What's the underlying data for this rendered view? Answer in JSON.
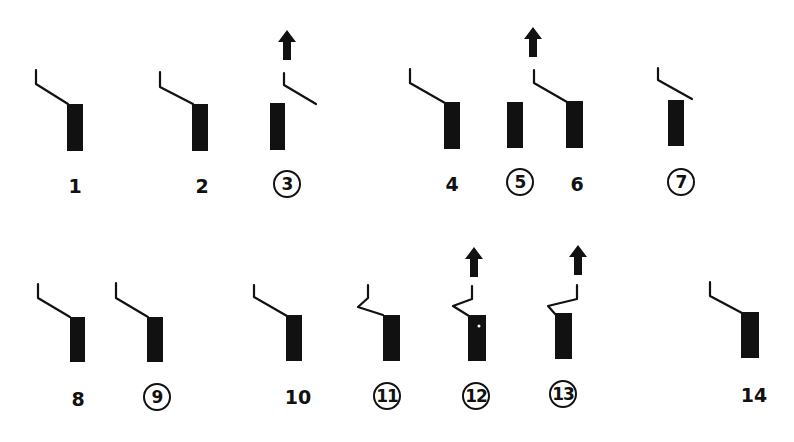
{
  "diagram": {
    "type": "numbered schematic figures (bar with hooked lead line)",
    "ink_color": "#111111",
    "background": "#ffffff",
    "rows": [
      {
        "figures": [
          {
            "id": 1,
            "label": "1",
            "circled": false,
            "arrow": false,
            "lead": "hook"
          },
          {
            "id": 2,
            "label": "2",
            "circled": false,
            "arrow": false,
            "lead": "hook"
          },
          {
            "id": 3,
            "label": "3",
            "circled": true,
            "arrow": true,
            "lead": "detached"
          },
          {
            "id": 4,
            "label": "4",
            "circled": false,
            "arrow": false,
            "lead": "hook"
          },
          {
            "id": 5,
            "label": "5",
            "circled": true,
            "arrow": true,
            "lead": "none"
          },
          {
            "id": 6,
            "label": "6",
            "circled": false,
            "arrow": false,
            "lead": "hook"
          },
          {
            "id": 7,
            "label": "7",
            "circled": true,
            "arrow": false,
            "lead": "detached"
          }
        ]
      },
      {
        "figures": [
          {
            "id": 8,
            "label": "8",
            "circled": false,
            "arrow": false,
            "lead": "hook"
          },
          {
            "id": 9,
            "label": "9",
            "circled": true,
            "arrow": false,
            "lead": "hook"
          },
          {
            "id": 10,
            "label": "10",
            "circled": false,
            "arrow": false,
            "lead": "hook"
          },
          {
            "id": 11,
            "label": "11",
            "circled": true,
            "arrow": false,
            "lead": "zigzag"
          },
          {
            "id": 12,
            "label": "12",
            "circled": true,
            "arrow": true,
            "lead": "zigzag"
          },
          {
            "id": 13,
            "label": "13",
            "circled": true,
            "arrow": true,
            "lead": "zigzag"
          },
          {
            "id": 14,
            "label": "14",
            "circled": false,
            "arrow": false,
            "lead": "hook"
          }
        ]
      }
    ]
  },
  "labels": {
    "f1": "1",
    "f2": "2",
    "f3": "3",
    "f4": "4",
    "f5": "5",
    "f6": "6",
    "f7": "7",
    "f8": "8",
    "f9": "9",
    "f10": "10",
    "f11": "11",
    "f12": "12",
    "f13": "13",
    "f14": "14"
  }
}
